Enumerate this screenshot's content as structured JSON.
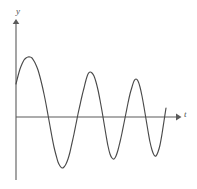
{
  "figure": {
    "kind": "damped-oscillation-graph",
    "background_color": "#ffffff",
    "axis_color": "#5a5a5a",
    "curve_color": "#4a4a4a",
    "y_axis_label": "y",
    "t_axis_label": "t"
  },
  "chart_data": {
    "type": "line",
    "title": "",
    "xlabel": "t",
    "ylabel": "y",
    "grid": false,
    "legend": null,
    "annotations": [],
    "axes": {
      "origin_px": [
        16,
        117
      ],
      "x_axis_y_px": 117,
      "y_axis_x_px": 16,
      "x_axis_end_px": 180,
      "y_axis_top_px": 20,
      "y_axis_bottom_px": 180,
      "x_arrow": true,
      "y_arrow": true,
      "tick_marks": false,
      "tick_labels": false
    },
    "model": {
      "form": "A*exp(-k*t)*sin(w*t+phi)",
      "amplitude_A": 62,
      "decay_k": 0.0105,
      "angular_frequency_w": 0.202,
      "phase_phi": 0.58,
      "t_start_px": 16,
      "t_end_px": 166
    },
    "key_points": {
      "start": {
        "x": 16,
        "y": 84
      },
      "maxima": [
        {
          "x": 33,
          "y": 57
        },
        {
          "x": 88,
          "y": 72
        },
        {
          "x": 127,
          "y": 78
        },
        {
          "x": 159,
          "y": 80
        }
      ],
      "minima": [
        {
          "x": 64,
          "y": 167
        },
        {
          "x": 108,
          "y": 158
        },
        {
          "x": 141,
          "y": 155
        }
      ],
      "zero_crossings": [
        48,
        79,
        95,
        122,
        132,
        152,
        163
      ],
      "end": {
        "x": 166,
        "y": 108
      }
    },
    "x": [
      16,
      18,
      20,
      22,
      24,
      26,
      28,
      30,
      32,
      34,
      36,
      38,
      40,
      42,
      44,
      46,
      48,
      50,
      52,
      54,
      56,
      58,
      60,
      62,
      64,
      66,
      68,
      70,
      72,
      74,
      76,
      78,
      80,
      82,
      84,
      86,
      88,
      90,
      92,
      94,
      96,
      98,
      100,
      102,
      104,
      106,
      108,
      110,
      112,
      114,
      116,
      118,
      120,
      122,
      124,
      126,
      128,
      130,
      132,
      134,
      136,
      138,
      140,
      142,
      144,
      146,
      148,
      150,
      152,
      154,
      156,
      158,
      160,
      162,
      164,
      166
    ],
    "y_pixel": [
      84,
      76,
      69,
      64,
      60,
      58,
      57,
      57,
      58,
      61,
      65,
      70,
      77,
      85,
      94,
      104,
      115,
      126,
      137,
      147,
      155,
      162,
      166,
      168,
      167,
      164,
      159,
      152,
      143,
      134,
      124,
      114,
      105,
      96,
      88,
      80,
      74,
      72,
      73,
      76,
      82,
      90,
      100,
      111,
      123,
      135,
      146,
      154,
      158,
      159,
      156,
      150,
      142,
      133,
      123,
      113,
      103,
      94,
      87,
      81,
      79,
      81,
      87,
      96,
      107,
      119,
      131,
      142,
      150,
      155,
      156,
      152,
      145,
      134,
      121,
      108
    ]
  }
}
